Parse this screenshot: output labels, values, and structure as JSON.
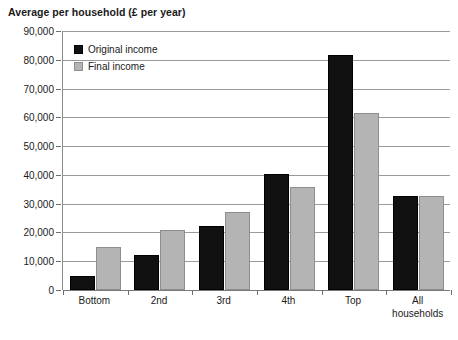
{
  "chart_data": {
    "type": "bar",
    "title": "Average per household (£ per year)",
    "xlabel": "",
    "ylabel": "",
    "ylim": [
      0,
      90000
    ],
    "ytick_step": 10000,
    "ytick_labels": [
      "90,000",
      "80,000",
      "70,000",
      "60,000",
      "50,000",
      "40,000",
      "30,000",
      "20,000",
      "10,000",
      "0"
    ],
    "ytick_values": [
      90000,
      80000,
      70000,
      60000,
      50000,
      40000,
      30000,
      20000,
      10000,
      0
    ],
    "grid": true,
    "legend_position": "top-left-inside",
    "categories": [
      "Bottom",
      "2nd",
      "3rd",
      "4th",
      "Top",
      "All\nhouseholds"
    ],
    "category_labels": [
      "Bottom",
      "2nd",
      "3rd",
      "4th",
      "Top",
      "All households"
    ],
    "series": [
      {
        "name": "Original income",
        "color": "#111111",
        "values": [
          5000,
          12000,
          22400,
          40300,
          81500,
          32800
        ]
      },
      {
        "name": "Final income",
        "color": "#b4b4b4",
        "values": [
          15000,
          21000,
          27200,
          35800,
          61500,
          32700
        ]
      }
    ]
  },
  "legend": {
    "items": [
      {
        "label": "Original income",
        "swatch": "original"
      },
      {
        "label": "Final income",
        "swatch": "final"
      }
    ]
  }
}
